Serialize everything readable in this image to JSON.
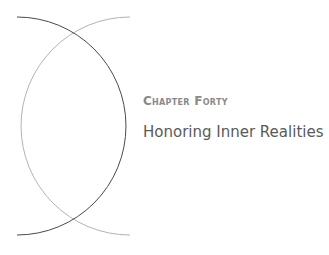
{
  "chapter": {
    "label": "Chapter Forty",
    "title": "Honoring Inner Realities"
  },
  "decoration": {
    "dark_arc_color": "#555555",
    "light_arc_color": "#aaaaaa"
  }
}
